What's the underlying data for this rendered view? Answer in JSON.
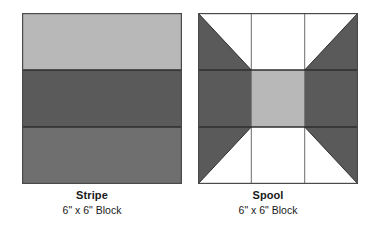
{
  "page": {
    "background_color": "#ffffff",
    "width": 367,
    "height": 232
  },
  "palette": {
    "light_gray": "#b8b8b8",
    "medium_gray": "#6f6f6f",
    "dark_gray": "#5a5a5a",
    "white": "#ffffff",
    "outline": "#3a3a3a",
    "text": "#1a1a1a"
  },
  "blocks": [
    {
      "id": "stripe",
      "title": "Stripe",
      "size": "6\" x 6\" Block",
      "pattern_type": "three-horizontal-bands",
      "bands": [
        {
          "name": "top-band",
          "fill": "#b8b8b8",
          "height_fraction": 0.333
        },
        {
          "name": "middle-band",
          "fill": "#5a5a5a",
          "height_fraction": 0.333
        },
        {
          "name": "bottom-band",
          "fill": "#6f6f6f",
          "height_fraction": 0.334
        }
      ]
    },
    {
      "id": "spool",
      "title": "Spool",
      "size": "6\" x 6\" Block",
      "pattern_type": "nine-patch-with-half-square-triangles",
      "units": [
        {
          "name": "top-left-corner",
          "fill": "#5a5a5a",
          "secondary_fill": "#ffffff",
          "shape": "half-square-triangle"
        },
        {
          "name": "top-center",
          "fill": "#ffffff",
          "shape": "square"
        },
        {
          "name": "top-right-corner",
          "fill": "#5a5a5a",
          "secondary_fill": "#ffffff",
          "shape": "half-square-triangle"
        },
        {
          "name": "middle-left",
          "fill": "#5a5a5a",
          "shape": "square"
        },
        {
          "name": "center",
          "fill": "#b8b8b8",
          "shape": "square"
        },
        {
          "name": "middle-right",
          "fill": "#5a5a5a",
          "shape": "square"
        },
        {
          "name": "bottom-left-corner",
          "fill": "#5a5a5a",
          "secondary_fill": "#ffffff",
          "shape": "half-square-triangle"
        },
        {
          "name": "bottom-center",
          "fill": "#ffffff",
          "shape": "square"
        },
        {
          "name": "bottom-right-corner",
          "fill": "#5a5a5a",
          "secondary_fill": "#ffffff",
          "shape": "half-square-triangle"
        }
      ]
    }
  ]
}
